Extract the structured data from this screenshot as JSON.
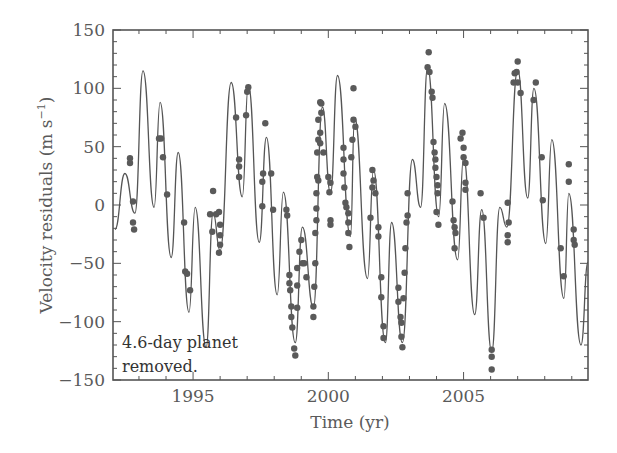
{
  "chart_data": {
    "type": "scatter",
    "title": "",
    "xlabel": "Time (yr)",
    "ylabel": "Velocity residuals (m s⁻¹)",
    "xlim": [
      1992.04,
      2009.6
    ],
    "ylim": [
      -150,
      150
    ],
    "xticks": [
      1995,
      2000,
      2005
    ],
    "xtick_labels": [
      "1995",
      "2000",
      "2005"
    ],
    "x_minor_step": 1,
    "yticks": [
      -150,
      -100,
      -50,
      0,
      50,
      100,
      150
    ],
    "ytick_labels": [
      "−150",
      "−100",
      "−50",
      "0",
      "50",
      "100",
      "150"
    ],
    "y_minor_step": 10,
    "grid": false,
    "legend": null,
    "annotation": {
      "lines": [
        "4.6-day planet",
        "removed."
      ],
      "position": "lower-left"
    },
    "colors": {
      "points": "#5a5a5a",
      "curve": "#555555",
      "axes": "#555555",
      "text": "#5a5a5a"
    },
    "series": [
      {
        "name": "Model fit (curve)",
        "kind": "line",
        "note": "local extrema of the fitted curve",
        "points": [
          [
            1992.11,
            -21
          ],
          [
            1992.48,
            27
          ],
          [
            1992.85,
            -7
          ],
          [
            1993.15,
            115
          ],
          [
            1993.56,
            -2
          ],
          [
            1993.78,
            88
          ],
          [
            1994.19,
            -45
          ],
          [
            1994.45,
            45
          ],
          [
            1994.85,
            -92
          ],
          [
            1995.08,
            -2
          ],
          [
            1995.48,
            -122
          ],
          [
            1995.74,
            -7
          ],
          [
            1996.0,
            -39
          ],
          [
            1996.41,
            105
          ],
          [
            1996.82,
            7
          ],
          [
            1997.04,
            103
          ],
          [
            1997.45,
            -32
          ],
          [
            1997.71,
            58
          ],
          [
            1998.11,
            -77
          ],
          [
            1998.34,
            11
          ],
          [
            1998.78,
            -118
          ],
          [
            1999.04,
            -19
          ],
          [
            1999.45,
            -88
          ],
          [
            1999.78,
            84
          ],
          [
            2000.08,
            10
          ],
          [
            2000.34,
            111
          ],
          [
            2000.82,
            -27
          ],
          [
            2000.97,
            75
          ],
          [
            2001.45,
            -63
          ],
          [
            2001.67,
            30
          ],
          [
            2002.11,
            -118
          ],
          [
            2002.34,
            -15
          ],
          [
            2002.74,
            -118
          ],
          [
            2003.11,
            39
          ],
          [
            2003.41,
            -2
          ],
          [
            2003.67,
            118
          ],
          [
            2004.08,
            -10
          ],
          [
            2004.3,
            87
          ],
          [
            2004.78,
            -47
          ],
          [
            2005.0,
            41
          ],
          [
            2005.41,
            -94
          ],
          [
            2005.67,
            -4
          ],
          [
            2006.04,
            -126
          ],
          [
            2006.34,
            -2
          ],
          [
            2006.6,
            -19
          ],
          [
            2007.0,
            116
          ],
          [
            2007.37,
            6
          ],
          [
            2007.6,
            100
          ],
          [
            2008.04,
            -33
          ],
          [
            2008.26,
            56
          ],
          [
            2008.71,
            -80
          ],
          [
            2008.89,
            10
          ],
          [
            2009.34,
            -120
          ],
          [
            2009.6,
            -49
          ]
        ]
      },
      {
        "name": "Observed residuals",
        "kind": "scatter",
        "points": [
          [
            1992.67,
            40
          ],
          [
            1992.67,
            36
          ],
          [
            1992.78,
            3
          ],
          [
            1992.78,
            -15
          ],
          [
            1992.82,
            -21
          ],
          [
            1993.74,
            57
          ],
          [
            1993.82,
            57
          ],
          [
            1993.89,
            41
          ],
          [
            1994.04,
            9
          ],
          [
            1994.67,
            -15
          ],
          [
            1994.71,
            -57
          ],
          [
            1994.78,
            -59
          ],
          [
            1994.89,
            -73
          ],
          [
            1995.74,
            12
          ],
          [
            1995.63,
            -8
          ],
          [
            1995.71,
            -23
          ],
          [
            1995.85,
            -8
          ],
          [
            1995.96,
            -6
          ],
          [
            1996.0,
            -17
          ],
          [
            1996.0,
            -26
          ],
          [
            1996.0,
            -34
          ],
          [
            1995.96,
            -41
          ],
          [
            1996.59,
            75
          ],
          [
            1996.7,
            39
          ],
          [
            1996.7,
            33
          ],
          [
            1996.7,
            24
          ],
          [
            1996.96,
            77
          ],
          [
            1997.04,
            101
          ],
          [
            1997.0,
            97
          ],
          [
            1997.67,
            70
          ],
          [
            1997.59,
            27
          ],
          [
            1997.56,
            20
          ],
          [
            1997.56,
            -1
          ],
          [
            1997.89,
            27
          ],
          [
            1997.96,
            -4
          ],
          [
            1998.45,
            -4
          ],
          [
            1998.48,
            -9
          ],
          [
            1998.56,
            -60
          ],
          [
            1998.56,
            -67
          ],
          [
            1998.59,
            -73
          ],
          [
            1998.63,
            -87
          ],
          [
            1998.63,
            -96
          ],
          [
            1998.67,
            -105
          ],
          [
            1998.74,
            -123
          ],
          [
            1998.78,
            -129
          ],
          [
            1998.85,
            -54
          ],
          [
            1998.85,
            -69
          ],
          [
            1998.85,
            -88
          ],
          [
            1998.93,
            -40
          ],
          [
            1999.0,
            -30
          ],
          [
            1999.04,
            -50
          ],
          [
            1999.11,
            -50
          ],
          [
            1999.19,
            -62
          ],
          [
            1999.45,
            -87
          ],
          [
            1999.45,
            -96
          ],
          [
            1999.48,
            -70
          ],
          [
            1999.52,
            -50
          ],
          [
            1999.52,
            -24
          ],
          [
            1999.56,
            -13
          ],
          [
            1999.56,
            -3
          ],
          [
            1999.56,
            10
          ],
          [
            1999.59,
            24
          ],
          [
            1999.63,
            21
          ],
          [
            1999.59,
            45
          ],
          [
            1999.63,
            56
          ],
          [
            1999.7,
            62
          ],
          [
            1999.7,
            53
          ],
          [
            1999.74,
            79
          ],
          [
            1999.74,
            87
          ],
          [
            1999.7,
            88
          ],
          [
            1999.82,
            45
          ],
          [
            1999.63,
            73
          ],
          [
            2000.0,
            24
          ],
          [
            2000.04,
            11
          ],
          [
            2000.08,
            19
          ],
          [
            2000.08,
            -13
          ],
          [
            2000.08,
            -17
          ],
          [
            2000.56,
            49
          ],
          [
            2000.56,
            39
          ],
          [
            2000.56,
            27
          ],
          [
            2000.59,
            15
          ],
          [
            2000.63,
            2
          ],
          [
            2000.67,
            -2
          ],
          [
            2000.74,
            -7
          ],
          [
            2000.74,
            -15
          ],
          [
            2000.74,
            -24
          ],
          [
            2000.78,
            -36
          ],
          [
            2000.93,
            100
          ],
          [
            2000.93,
            73
          ],
          [
            2001.0,
            67
          ],
          [
            2000.89,
            56
          ],
          [
            2000.85,
            41
          ],
          [
            2001.63,
            30
          ],
          [
            2001.67,
            21
          ],
          [
            2001.63,
            15
          ],
          [
            2001.74,
            10
          ],
          [
            2001.56,
            -11
          ],
          [
            2001.85,
            -19
          ],
          [
            2001.85,
            -27
          ],
          [
            2001.96,
            -62
          ],
          [
            2001.96,
            -79
          ],
          [
            2002.04,
            -104
          ],
          [
            2002.04,
            -114
          ],
          [
            2002.59,
            -71
          ],
          [
            2002.59,
            -83
          ],
          [
            2002.67,
            -96
          ],
          [
            2002.7,
            -101
          ],
          [
            2002.7,
            -113
          ],
          [
            2002.74,
            -122
          ],
          [
            2002.78,
            -80
          ],
          [
            2002.82,
            -58
          ],
          [
            2002.85,
            -37
          ],
          [
            2002.89,
            -15
          ],
          [
            2002.93,
            -9
          ],
          [
            2002.93,
            10
          ],
          [
            2003.71,
            131
          ],
          [
            2003.67,
            118
          ],
          [
            2003.74,
            114
          ],
          [
            2003.82,
            97
          ],
          [
            2003.85,
            92
          ],
          [
            2003.89,
            54
          ],
          [
            2003.93,
            45
          ],
          [
            2003.96,
            39
          ],
          [
            2003.96,
            32
          ],
          [
            2004.0,
            24
          ],
          [
            2004.04,
            17
          ],
          [
            2004.04,
            10
          ],
          [
            2004.0,
            -6
          ],
          [
            2004.07,
            -17
          ],
          [
            2004.59,
            3
          ],
          [
            2004.63,
            -13
          ],
          [
            2004.67,
            -19
          ],
          [
            2004.7,
            -24
          ],
          [
            2004.67,
            -37
          ],
          [
            2004.89,
            57
          ],
          [
            2004.96,
            62
          ],
          [
            2005.0,
            49
          ],
          [
            2005.0,
            41
          ],
          [
            2005.07,
            36
          ],
          [
            2005.07,
            19
          ],
          [
            2005.07,
            13
          ],
          [
            2005.63,
            10
          ],
          [
            2005.74,
            -11
          ],
          [
            2006.04,
            -124
          ],
          [
            2006.04,
            -130
          ],
          [
            2006.04,
            -141
          ],
          [
            2006.63,
            2
          ],
          [
            2006.67,
            -15
          ],
          [
            2006.63,
            -26
          ],
          [
            2006.63,
            -32
          ],
          [
            2006.89,
            113
          ],
          [
            2006.96,
            114
          ],
          [
            2007.0,
            123
          ],
          [
            2007.0,
            105
          ],
          [
            2006.85,
            105
          ],
          [
            2007.11,
            96
          ],
          [
            2007.67,
            105
          ],
          [
            2007.59,
            90
          ],
          [
            2007.89,
            41
          ],
          [
            2007.93,
            4
          ],
          [
            2008.59,
            -37
          ],
          [
            2008.7,
            -61
          ],
          [
            2008.89,
            35
          ],
          [
            2008.89,
            20
          ],
          [
            2009.07,
            -21
          ],
          [
            2009.07,
            -30
          ],
          [
            2009.11,
            -34
          ]
        ]
      }
    ]
  },
  "labels": {
    "xlabel": "Time (yr)",
    "ylabel_main": "Velocity residuals (m s",
    "ylabel_exp": "−1",
    "ylabel_close": ")",
    "annotation_line1": "4.6-day planet",
    "annotation_line2": "removed."
  }
}
